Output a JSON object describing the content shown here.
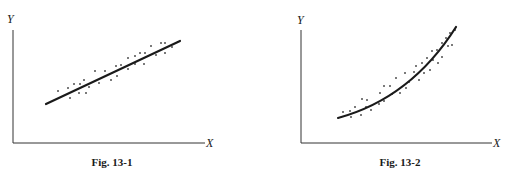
{
  "chart_data": [
    {
      "type": "scatter",
      "caption": "Fig. 13-1",
      "xlabel": "X",
      "ylabel": "Y",
      "grid": false,
      "legend": null,
      "fit": {
        "type": "line",
        "description": "linear least-squares regression line",
        "from": [
          46,
          104
        ],
        "to": [
          180,
          41
        ]
      },
      "points": [
        [
          58,
          91
        ],
        [
          68,
          88
        ],
        [
          70,
          98
        ],
        [
          74,
          84
        ],
        [
          80,
          84
        ],
        [
          79,
          93
        ],
        [
          84,
          80
        ],
        [
          86,
          93
        ],
        [
          89,
          87
        ],
        [
          95,
          71
        ],
        [
          99,
          83
        ],
        [
          105,
          71
        ],
        [
          111,
          80
        ],
        [
          116,
          66
        ],
        [
          117,
          76
        ],
        [
          121,
          65
        ],
        [
          128,
          58
        ],
        [
          128,
          69
        ],
        [
          135,
          56
        ],
        [
          135,
          64
        ],
        [
          140,
          53
        ],
        [
          145,
          53
        ],
        [
          144,
          64
        ],
        [
          151,
          46
        ],
        [
          156,
          55
        ],
        [
          161,
          43
        ],
        [
          165,
          43
        ],
        [
          165,
          53
        ],
        [
          172,
          47
        ]
      ],
      "line_color": "#1a1a1a",
      "point_color": "#333333"
    },
    {
      "type": "scatter",
      "caption": "Fig. 13-2",
      "xlabel": "X",
      "ylabel": "Y",
      "grid": false,
      "legend": null,
      "fit": {
        "type": "curve",
        "description": "nonlinear (exponential-like) regression curve",
        "from": [
          338,
          118
        ],
        "to": [
          456,
          27
        ]
      },
      "points": [
        [
          343,
          112
        ],
        [
          350,
          111
        ],
        [
          351,
          117
        ],
        [
          355,
          107
        ],
        [
          361,
          115
        ],
        [
          362,
          99
        ],
        [
          366,
          107
        ],
        [
          367,
          100
        ],
        [
          371,
          110
        ],
        [
          379,
          104
        ],
        [
          380,
          93
        ],
        [
          384,
          101
        ],
        [
          384,
          86
        ],
        [
          390,
          86
        ],
        [
          392,
          94
        ],
        [
          396,
          78
        ],
        [
          400,
          93
        ],
        [
          405,
          73
        ],
        [
          406,
          88
        ],
        [
          409,
          82
        ],
        [
          414,
          72
        ],
        [
          416,
          66
        ],
        [
          419,
          80
        ],
        [
          422,
          63
        ],
        [
          424,
          73
        ],
        [
          427,
          58
        ],
        [
          430,
          70
        ],
        [
          432,
          51
        ],
        [
          433,
          60
        ],
        [
          437,
          50
        ],
        [
          438,
          63
        ],
        [
          442,
          43
        ],
        [
          442,
          57
        ],
        [
          446,
          38
        ],
        [
          448,
          46
        ],
        [
          450,
          33
        ],
        [
          452,
          45
        ],
        [
          455,
          30
        ]
      ],
      "line_color": "#1a1a1a",
      "point_color": "#333333"
    }
  ],
  "figures": [
    {
      "caption": "Fig. 13-1",
      "x_axis_label": "X",
      "y_axis_label": "Y"
    },
    {
      "caption": "Fig. 13-2",
      "x_axis_label": "X",
      "y_axis_label": "Y"
    }
  ]
}
